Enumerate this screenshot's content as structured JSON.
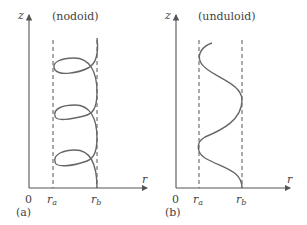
{
  "panels": [
    {
      "id": "a",
      "panel_label": "(a)",
      "title": "(nodoid)",
      "axes": {
        "vertical": "z",
        "horizontal": "r",
        "origin": "0"
      },
      "markers": {
        "ra": "r",
        "ra_sub": "a",
        "rb": "r",
        "rb_sub": "b"
      }
    },
    {
      "id": "b",
      "panel_label": "(b)",
      "title": "(unduloid)",
      "axes": {
        "vertical": "z",
        "horizontal": "r",
        "origin": "0"
      },
      "markers": {
        "ra": "r",
        "ra_sub": "a",
        "rb": "r",
        "rb_sub": "b"
      }
    }
  ],
  "colors": {
    "line": "#555555",
    "curve": "#666666",
    "text": "#444444"
  }
}
